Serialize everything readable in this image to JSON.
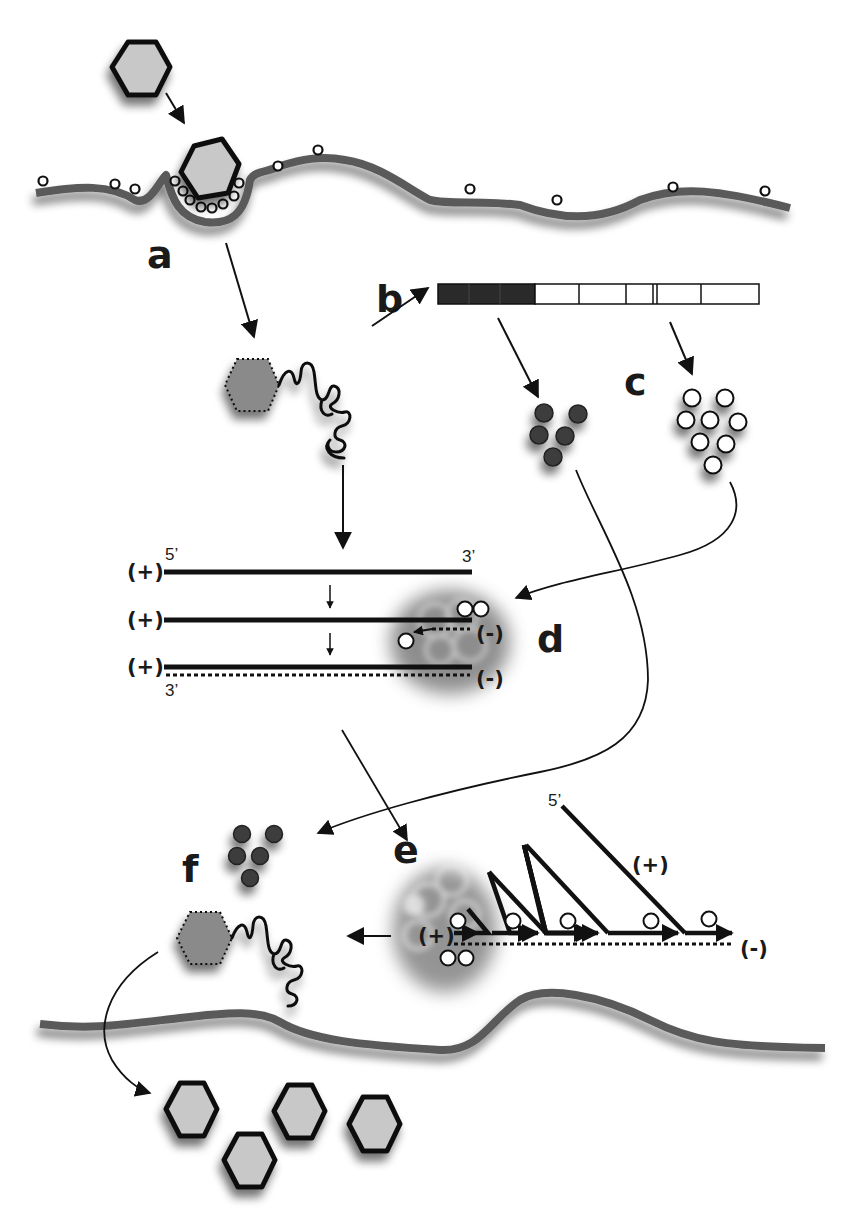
{
  "figure": {
    "colors": {
      "membrane": "#5a5a5a",
      "capsid_fill": "#c8c8c8",
      "outline": "#111111",
      "dark_protein": "#3c3c3c",
      "light_protein": "#ffffff",
      "polyprotein_dark": "#2a2a2a",
      "background": "#ffffff"
    },
    "step_labels": {
      "a": "a",
      "b": "b",
      "c": "c",
      "d": "d",
      "e": "e",
      "f": "f"
    },
    "rna_labels": {
      "plus": "(+)",
      "minus": "(-)",
      "five_prime": "5’",
      "three_prime": "3’"
    },
    "polyprotein": {
      "segments": [
        {
          "type": "dark"
        },
        {
          "type": "dark"
        },
        {
          "type": "dark"
        },
        {
          "type": "light"
        },
        {
          "type": "light"
        },
        {
          "type": "light"
        },
        {
          "type": "light"
        },
        {
          "type": "light"
        }
      ]
    },
    "progeny_virions": 4,
    "dark_protein_count": 5,
    "light_protein_count": 8
  }
}
